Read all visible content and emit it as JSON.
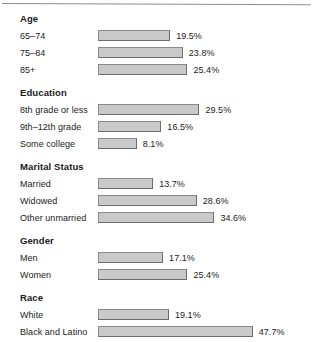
{
  "figure": {
    "bar_fill_color": "#c9c9c9",
    "bar_border_color": "#6d6d6d",
    "text_color": "#1a1a1a",
    "rule_color": "#8e8e8e"
  },
  "chart_data": {
    "type": "bar",
    "orientation": "horizontal",
    "title": "",
    "subtitle": "",
    "xlabel": "",
    "ylabel": "",
    "xlim": [
      0,
      50
    ],
    "grid": false,
    "legend": "none",
    "value_format": "percent",
    "value_suffix": "%",
    "groups": [
      {
        "name": "Age",
        "categories": [
          "65–74",
          "75–84",
          "85+"
        ],
        "values": [
          19.5,
          23.8,
          25.4
        ],
        "labels": [
          "19.5%",
          "23.8%",
          "25.4%"
        ]
      },
      {
        "name": "Education",
        "categories": [
          "8th grade or less",
          "9th–12th grade",
          "Some college"
        ],
        "values": [
          29.5,
          16.5,
          8.1
        ],
        "labels": [
          "29.5%",
          "16.5%",
          "8.1%"
        ]
      },
      {
        "name": "Marital Status",
        "categories": [
          "Married",
          "Widowed",
          "Other unmarried"
        ],
        "values": [
          13.7,
          28.6,
          34.6
        ],
        "labels": [
          "13.7%",
          "28.6%",
          "34.6%"
        ]
      },
      {
        "name": "Gender",
        "categories": [
          "Men",
          "Women"
        ],
        "values": [
          17.1,
          25.4
        ],
        "labels": [
          "17.1%",
          "25.4%"
        ]
      },
      {
        "name": "Race",
        "categories": [
          "White",
          "Black and Latino"
        ],
        "values": [
          19.1,
          47.7
        ],
        "labels": [
          "19.1%",
          "47.7%"
        ]
      }
    ],
    "categories": [
      "65–74",
      "75–84",
      "85+",
      "8th grade or less",
      "9th–12th grade",
      "Some college",
      "Married",
      "Widowed",
      "Other unmarried",
      "Men",
      "Women",
      "White",
      "Black and Latino"
    ],
    "values": [
      19.5,
      23.8,
      25.4,
      29.5,
      16.5,
      8.1,
      13.7,
      28.6,
      34.6,
      17.1,
      25.4,
      19.1,
      47.7
    ]
  }
}
